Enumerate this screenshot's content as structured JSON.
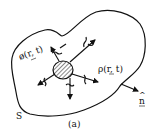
{
  "diagram": {
    "caption": "(a)",
    "surface_label": "S",
    "potential_label": "ø(r, t)",
    "density_label": "ρ(r, t)",
    "normal_label": "n",
    "normal_hat": "^"
  },
  "colors": {
    "ink": "#111111",
    "background": "#ffffff"
  }
}
